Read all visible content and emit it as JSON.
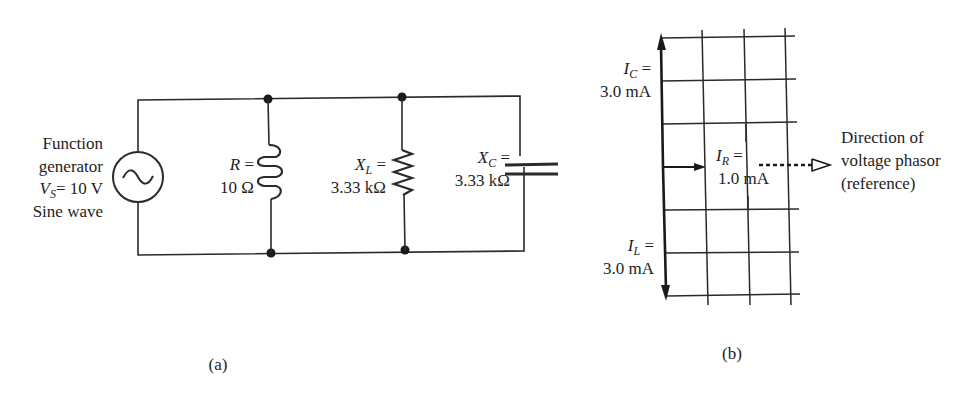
{
  "circuit": {
    "source": {
      "line1": "Function",
      "line2": "generator",
      "voltage_symbol": "V",
      "voltage_sub": "S",
      "voltage_value": "= 10 V",
      "line4": "Sine wave",
      "icon": "ac-source-icon"
    },
    "r_branch": {
      "symbol": "R",
      "eq": " =",
      "value": "10 Ω",
      "icon": "inductor-coil-icon"
    },
    "xl_branch": {
      "symbol": "X",
      "sub": "L",
      "eq": " =",
      "value": "3.33 kΩ",
      "icon": "resistor-zigzag-icon"
    },
    "xc_branch": {
      "symbol": "X",
      "sub": "C",
      "eq": " =",
      "value": "3.33 kΩ",
      "icon": "capacitor-icon"
    },
    "caption": "(a)"
  },
  "phasor": {
    "ic": {
      "symbol": "I",
      "sub": "C",
      "eq": " =",
      "value": "3.0 mA"
    },
    "ir": {
      "symbol": "I",
      "sub": "R",
      "eq": " =",
      "value": "1.0 mA"
    },
    "il": {
      "symbol": "I",
      "sub": "L",
      "eq": " =",
      "value": "3.0 mA"
    },
    "reference": {
      "line1": "Direction of",
      "line2": "voltage phasor",
      "line3": "(reference)"
    },
    "caption": "(b)"
  },
  "colors": {
    "ink": "#1e1e1e",
    "background": "#ffffff"
  }
}
